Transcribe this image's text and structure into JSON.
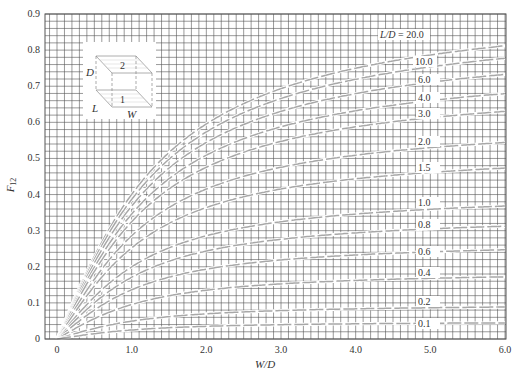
{
  "chart_data": {
    "type": "line",
    "title": "",
    "xlabel": "W/D",
    "ylabel": "F12",
    "ylabel_main": "F",
    "ylabel_sub": "12",
    "xlim": [
      -0.16,
      6.0
    ],
    "ylim": [
      0,
      0.9
    ],
    "grid": true,
    "grid_minor": {
      "x_step": 0.1,
      "y_step": 0.02
    },
    "x_ticks": [
      {
        "v": 0,
        "label": "0"
      },
      {
        "v": 1,
        "label": "1.0"
      },
      {
        "v": 2,
        "label": "2.0"
      },
      {
        "v": 3,
        "label": "3.0"
      },
      {
        "v": 4,
        "label": "4.0"
      },
      {
        "v": 5,
        "label": "5.0"
      },
      {
        "v": 6,
        "label": "6.0"
      }
    ],
    "y_ticks": [
      {
        "v": 0,
        "label": "0"
      },
      {
        "v": 0.1,
        "label": "0.1"
      },
      {
        "v": 0.2,
        "label": "0.2"
      },
      {
        "v": 0.3,
        "label": "0.3"
      },
      {
        "v": 0.4,
        "label": "0.4"
      },
      {
        "v": 0.5,
        "label": "0.5"
      },
      {
        "v": 0.6,
        "label": "0.6"
      },
      {
        "v": 0.7,
        "label": "0.7"
      },
      {
        "v": 0.8,
        "label": "0.8"
      },
      {
        "v": 0.9,
        "label": "0.9"
      }
    ],
    "parameter": "L/D",
    "series": [
      {
        "name": "20.0",
        "label": "L/D = 20.0",
        "L_over_D": 20.0,
        "label_y": 37,
        "label_x": 380
      },
      {
        "name": "10.0",
        "label": "10.0",
        "L_over_D": 10.0,
        "label_y": 64,
        "label_x": 415
      },
      {
        "name": "6.0",
        "label": "6.0",
        "L_over_D": 6.0,
        "label_y": 82,
        "label_x": 418
      },
      {
        "name": "4.0",
        "label": "4.0",
        "L_over_D": 4.0,
        "label_y": 100,
        "label_x": 418
      },
      {
        "name": "3.0",
        "label": "3.0",
        "L_over_D": 3.0,
        "label_y": 116,
        "label_x": 418
      },
      {
        "name": "2.0",
        "label": "2.0",
        "L_over_D": 2.0,
        "label_y": 144,
        "label_x": 418
      },
      {
        "name": "1.5",
        "label": "1.5",
        "L_over_D": 1.5,
        "label_y": 170,
        "label_x": 418
      },
      {
        "name": "1.0",
        "label": "1.0",
        "L_over_D": 1.0,
        "label_y": 205,
        "label_x": 418
      },
      {
        "name": "0.8",
        "label": "0.8",
        "L_over_D": 0.8,
        "label_y": 227,
        "label_x": 418
      },
      {
        "name": "0.6",
        "label": "0.6",
        "L_over_D": 0.6,
        "label_y": 254,
        "label_x": 418
      },
      {
        "name": "0.4",
        "label": "0.4",
        "L_over_D": 0.4,
        "label_y": 275,
        "label_x": 418
      },
      {
        "name": "0.2",
        "label": "0.2",
        "L_over_D": 0.2,
        "label_y": 304,
        "label_x": 418
      },
      {
        "name": "0.1",
        "label": "0.1",
        "L_over_D": 0.1,
        "label_y": 326,
        "label_x": 418
      }
    ],
    "values_at_W_over_D_6": {
      "20.0": 0.85,
      "10.0": 0.79,
      "6.0": 0.74,
      "4.0": 0.68,
      "3.0": 0.62,
      "2.0": 0.53,
      "1.5": 0.46,
      "1.0": 0.36,
      "0.8": 0.31,
      "0.6": 0.24,
      "0.4": 0.17,
      "0.2": 0.09,
      "0.1": 0.045
    },
    "inset": {
      "description": "Two parallel aligned rectangles, surface 1 below surface 2, separated by D",
      "labels": {
        "top_plate": "2",
        "bottom_plate": "1",
        "height": "D",
        "length": "L",
        "width": "W"
      }
    }
  }
}
